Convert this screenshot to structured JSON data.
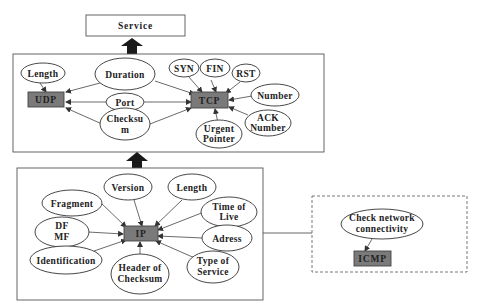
{
  "service": {
    "label": "Service"
  },
  "transport_layer": {
    "udp": {
      "label": "UDP"
    },
    "tcp": {
      "label": "TCP"
    },
    "udp_fields": [
      {
        "label": "Length"
      }
    ],
    "shared_fields": [
      {
        "label": "Duration"
      },
      {
        "label": "Port"
      },
      {
        "label_line1": "Checksu",
        "label_line2": "m"
      }
    ],
    "tcp_fields": [
      {
        "label": "SYN"
      },
      {
        "label": "FIN"
      },
      {
        "label": "RST"
      },
      {
        "label": "Number"
      },
      {
        "label_line1": "ACK",
        "label_line2": "Number"
      },
      {
        "label_line1": "Urgent",
        "label_line2": "Pointer"
      }
    ]
  },
  "network_layer": {
    "ip": {
      "label": "IP"
    },
    "ip_fields": [
      {
        "label": "Version"
      },
      {
        "label": "Length"
      },
      {
        "label": "Fragment"
      },
      {
        "label_line1": "Time of",
        "label_line2": "Live"
      },
      {
        "label_line1": "DF",
        "label_line2": "MF"
      },
      {
        "label": "Adress"
      },
      {
        "label": "Identification"
      },
      {
        "label_line1": "Header of",
        "label_line2": "Checksum"
      },
      {
        "label_line1": "Type of",
        "label_line2": "Service"
      }
    ]
  },
  "icmp_group": {
    "icmp": {
      "label": "ICMP"
    },
    "purpose": {
      "label_line1": "Check network",
      "label_line2": "connectivity"
    }
  },
  "colors": {
    "node_fill": "#7a7a7a",
    "stroke": "#444444",
    "arrow": "#1a1a1a",
    "background": "#ffffff"
  }
}
